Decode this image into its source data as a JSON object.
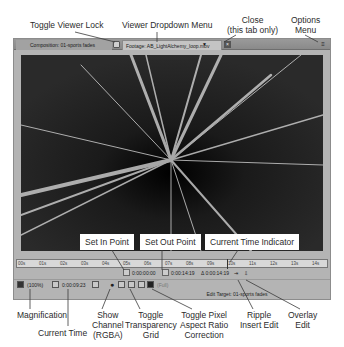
{
  "callouts": {
    "toggle_viewer_lock": "Toggle Viewer Lock",
    "viewer_dropdown_menu": "Viewer Dropdown Menu",
    "close_line1": "Close",
    "close_line2": "(this tab only)",
    "options_line1": "Options",
    "options_line2": "Menu",
    "set_in_point": "Set In Point",
    "set_out_point": "Set Out Point",
    "current_time_indicator": "Current Time Indicator",
    "magnification": "Magnification",
    "current_time": "Current Time",
    "show_channel_line1": "Show",
    "show_channel_line2": "Channel",
    "show_channel_line3": "(RGBA)",
    "toggle_transparency_line1": "Toggle",
    "toggle_transparency_line2": "Transparency",
    "toggle_transparency_line3": "Grid",
    "toggle_pixel_line1": "Toggle Pixel",
    "toggle_pixel_line2": "Aspect Ratio",
    "toggle_pixel_line3": "Correction",
    "ripple_line1": "Ripple",
    "ripple_line2": "Insert Edit",
    "overlay_line1": "Overlay",
    "overlay_line2": "Edit"
  },
  "tabs": {
    "composition": "Composition: 01-sports fades",
    "footage": "Footage: AB_LightAlchemy_loop.mov",
    "dropdown_glyph": "▼",
    "close_glyph": "×",
    "options_glyph": "≡"
  },
  "ruler": {
    "ticks": [
      "00s",
      "01s",
      "02s",
      "03s",
      "04s",
      "05s",
      "06s",
      "07s",
      "08s",
      "09s",
      "10s",
      "11s",
      "12s",
      "13s",
      "14s"
    ]
  },
  "timebar": {
    "in_point": "0:00:00:00",
    "out_point": "0:00:14:19",
    "duration": "Δ 0:00:14:19",
    "ripple_glyph": "⇥",
    "overlay_glyph": "⇩"
  },
  "bottombar": {
    "magnification": "(100%)",
    "current_time": "0:00:09:23",
    "resolution_hint": "(Full)",
    "channel_glyph": "●"
  },
  "edit_target": "Edit Target: 01-sports fades"
}
